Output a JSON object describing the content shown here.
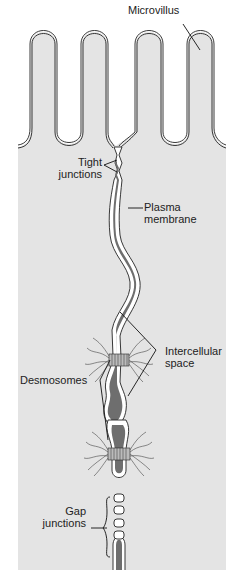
{
  "diagram": {
    "labels": {
      "microvillus": "Microvillus",
      "tight_junctions_1": "Tight",
      "tight_junctions_2": "junctions",
      "plasma_membrane_1": "Plasma",
      "plasma_membrane_2": "membrane",
      "intercellular_space_1": "Intercellular",
      "intercellular_space_2": "space",
      "desmosomes": "Desmosomes",
      "gap_junctions_1": "Gap",
      "gap_junctions_2": "junctions"
    },
    "colors": {
      "cytoplasm": "#e4e4e4",
      "intercellular": "#6e6e6e",
      "membrane": "#222222",
      "background": "#ffffff"
    }
  }
}
